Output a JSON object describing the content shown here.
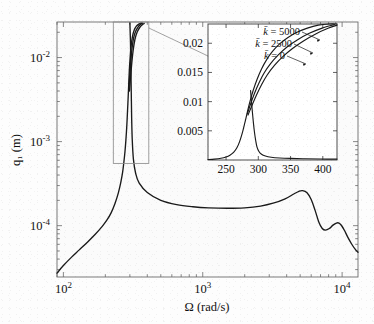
{
  "figure": {
    "kind": "frequency-response-plot",
    "background_color": "#fdfdfd",
    "curve_color": "#1a1a1a",
    "frame_color": "#4d4d4d",
    "inset_frame_color": "#3a3a3a"
  },
  "chart_data": {
    "type": "line",
    "title": "",
    "xlabel": "Ω (rad/s)",
    "ylabel": "q₁ (m)",
    "xscale": "log",
    "yscale": "log",
    "xlim": [
      90,
      13000
    ],
    "ylim": [
      2.45e-05,
      0.0265
    ],
    "grid": false,
    "legend_position": "inset-top-left",
    "xticks": [
      {
        "value": 100,
        "label": "10²",
        "mantissa": "10",
        "exponent": "2"
      },
      {
        "value": 1000,
        "label": "10³",
        "mantissa": "10",
        "exponent": "3"
      },
      {
        "value": 10000,
        "label": "10⁴",
        "mantissa": "10",
        "exponent": "4"
      }
    ],
    "yticks": [
      {
        "value": 0.01,
        "label": "10⁻²",
        "mantissa": "10",
        "exponent": "-2"
      },
      {
        "value": 0.001,
        "label": "10⁻³",
        "mantissa": "10",
        "exponent": "-3"
      },
      {
        "value": 0.0001,
        "label": "10⁻⁴",
        "mantissa": "10",
        "exponent": "-4"
      }
    ],
    "series": [
      {
        "name": "k̄ = 0",
        "points": [
          [
            90,
            2.72e-05
          ],
          [
            100,
            3.35e-05
          ],
          [
            115,
            4.25e-05
          ],
          [
            130,
            5.15e-05
          ],
          [
            150,
            6.45e-05
          ],
          [
            170,
            7.95e-05
          ],
          [
            190,
            9.8e-05
          ],
          [
            205,
            0.000116
          ],
          [
            220,
            0.000142
          ],
          [
            235,
            0.000185
          ],
          [
            248,
            0.000246
          ],
          [
            258,
            0.000325
          ],
          [
            266,
            0.00043
          ],
          [
            272,
            0.00058
          ],
          [
            277,
            0.00078
          ],
          [
            281,
            0.00105
          ],
          [
            285,
            0.00152
          ],
          [
            288,
            0.00215
          ],
          [
            291,
            0.0031
          ],
          [
            294,
            0.0046
          ],
          [
            297,
            0.0068
          ],
          [
            301,
            0.0098
          ],
          [
            306,
            0.0136
          ],
          [
            313,
            0.0178
          ],
          [
            322,
            0.0212
          ],
          [
            335,
            0.0238
          ],
          [
            350,
            0.0252
          ],
          [
            362,
            0.0258
          ]
        ]
      },
      {
        "name": "k̄ = 2500",
        "points": [
          [
            295,
            0.0042
          ],
          [
            300,
            0.0064
          ],
          [
            305,
            0.0093
          ],
          [
            311,
            0.0129
          ],
          [
            319,
            0.017
          ],
          [
            330,
            0.0205
          ],
          [
            344,
            0.0232
          ],
          [
            358,
            0.0248
          ],
          [
            370,
            0.0257
          ]
        ]
      },
      {
        "name": "k̄ = 5000",
        "points": [
          [
            298,
            0.004
          ],
          [
            304,
            0.006
          ],
          [
            310,
            0.0088
          ],
          [
            317,
            0.0123
          ],
          [
            326,
            0.0164
          ],
          [
            338,
            0.02
          ],
          [
            353,
            0.0228
          ],
          [
            368,
            0.0245
          ],
          [
            380,
            0.0255
          ]
        ]
      },
      {
        "name": "lower-branch",
        "points": [
          [
            300,
            0.026
          ],
          [
            303,
            0.015
          ],
          [
            305,
            0.0078
          ],
          [
            307,
            0.0038
          ],
          [
            309,
            0.0019
          ],
          [
            312,
            0.00105
          ],
          [
            318,
            0.00062
          ],
          [
            330,
            0.00042
          ],
          [
            350,
            0.00032
          ],
          [
            400,
            0.000248
          ],
          [
            500,
            0.0002
          ],
          [
            650,
            0.000178
          ],
          [
            850,
            0.000168
          ],
          [
            1100,
            0.000163
          ],
          [
            1500,
            0.000161
          ],
          [
            2000,
            0.000163
          ],
          [
            2600,
            0.000171
          ],
          [
            3200,
            0.000185
          ],
          [
            3900,
            0.000209
          ],
          [
            4500,
            0.000238
          ],
          [
            4900,
            0.000256
          ],
          [
            5200,
            0.000261
          ],
          [
            5600,
            0.000247
          ],
          [
            6000,
            0.000205
          ],
          [
            6400,
            0.000152
          ],
          [
            6800,
            0.0001105
          ],
          [
            7200,
            9.25e-05
          ],
          [
            7600,
            8.85e-05
          ],
          [
            8100,
            9.25e-05
          ],
          [
            8600,
            0.0001015
          ],
          [
            9100,
            0.0001075
          ],
          [
            9500,
            0.0001075
          ],
          [
            9900,
            0.0001005
          ],
          [
            10400,
            8.75e-05
          ],
          [
            11000,
            7.25e-05
          ],
          [
            11700,
            6.05e-05
          ],
          [
            12400,
            5.25e-05
          ],
          [
            13000,
            4.82e-05
          ]
        ]
      }
    ]
  },
  "inset": {
    "xlabel": "",
    "ylabel": "",
    "xlim": [
      222,
      422
    ],
    "ylim": [
      0,
      0.0233
    ],
    "xticks": [
      {
        "value": 250,
        "label": "250"
      },
      {
        "value": 300,
        "label": "300"
      },
      {
        "value": 350,
        "label": "350"
      },
      {
        "value": 400,
        "label": "400"
      }
    ],
    "yticks": [
      {
        "value": 0.005,
        "label": "0.005"
      },
      {
        "value": 0.01,
        "label": "0.01"
      },
      {
        "value": 0.015,
        "label": "0.015"
      },
      {
        "value": 0.02,
        "label": "0.02"
      }
    ],
    "annotations": [
      {
        "id": "k5000",
        "symbol": "k̄",
        "equals": "=",
        "value": "5000",
        "label": "k̄ = 5000"
      },
      {
        "id": "k2500",
        "symbol": "k̄",
        "equals": "=",
        "value": "2500",
        "label": "k̄ = 2500"
      },
      {
        "id": "k0",
        "symbol": "k̄",
        "equals": "=",
        "value": "0",
        "label": "k̄ = 0"
      }
    ],
    "series": [
      {
        "name": "k̄ = 0",
        "points": [
          [
            222,
            8e-05
          ],
          [
            232,
            0.00016
          ],
          [
            242,
            0.0003
          ],
          [
            250,
            0.00052
          ],
          [
            256,
            0.00082
          ],
          [
            262,
            0.00135
          ],
          [
            267,
            0.00215
          ],
          [
            271,
            0.00315
          ],
          [
            275,
            0.00455
          ],
          [
            279,
            0.0063
          ],
          [
            283,
            0.0082
          ],
          [
            287,
            0.01
          ],
          [
            292,
            0.0119
          ],
          [
            298,
            0.0138
          ],
          [
            305,
            0.0156
          ],
          [
            313,
            0.0172
          ],
          [
            322,
            0.0186
          ],
          [
            333,
            0.0199
          ],
          [
            346,
            0.021
          ],
          [
            360,
            0.0219
          ],
          [
            376,
            0.0226
          ],
          [
            393,
            0.0231
          ],
          [
            410,
            0.0233
          ],
          [
            422,
            0.0233
          ]
        ]
      },
      {
        "name": "k̄ = 2500",
        "points": [
          [
            283,
            0.0079
          ],
          [
            288,
            0.0096
          ],
          [
            294,
            0.0114
          ],
          [
            301,
            0.0132
          ],
          [
            309,
            0.0149
          ],
          [
            319,
            0.0165
          ],
          [
            331,
            0.018
          ],
          [
            345,
            0.0194
          ],
          [
            361,
            0.0206
          ],
          [
            379,
            0.0217
          ],
          [
            399,
            0.0226
          ],
          [
            418,
            0.0232
          ]
        ]
      },
      {
        "name": "k̄ = 5000",
        "points": [
          [
            284,
            0.0077
          ],
          [
            290,
            0.0093
          ],
          [
            297,
            0.0111
          ],
          [
            305,
            0.0129
          ],
          [
            314,
            0.0146
          ],
          [
            325,
            0.0162
          ],
          [
            338,
            0.0177
          ],
          [
            353,
            0.0191
          ],
          [
            370,
            0.0204
          ],
          [
            389,
            0.0216
          ],
          [
            409,
            0.0226
          ],
          [
            422,
            0.0231
          ]
        ]
      },
      {
        "name": "lower-branch",
        "points": [
          [
            288,
            0.0119
          ],
          [
            290,
            0.0092
          ],
          [
            292,
            0.0068
          ],
          [
            294,
            0.0048
          ],
          [
            296,
            0.0033
          ],
          [
            298,
            0.0022
          ],
          [
            301,
            0.00145
          ],
          [
            305,
            0.00098
          ],
          [
            311,
            0.00068
          ],
          [
            320,
            0.00048
          ],
          [
            333,
            0.00035
          ],
          [
            350,
            0.00027
          ],
          [
            372,
            0.00021
          ],
          [
            396,
            0.00017
          ],
          [
            422,
            0.00015
          ]
        ]
      }
    ]
  },
  "zoom_box": {
    "name": "zoom-region-rectangle",
    "x_range": [
      228,
      410
    ],
    "y_range": [
      0.00055,
      0.0265
    ]
  }
}
